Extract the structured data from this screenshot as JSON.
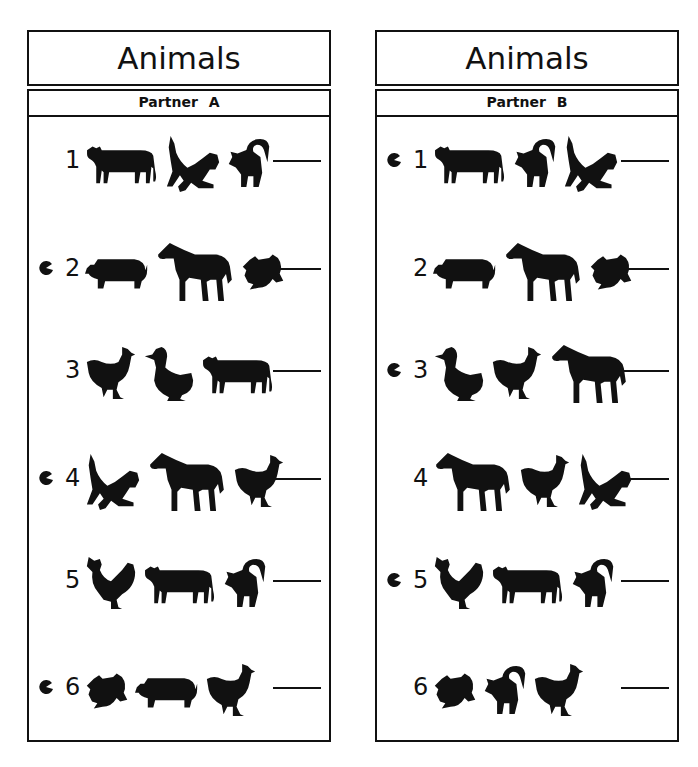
{
  "colors": {
    "ink": "#111111",
    "paper": "#ffffff"
  },
  "panels": [
    {
      "title": "Animals",
      "partner_label": "Partner A",
      "rows": [
        {
          "number": "1",
          "marked": false,
          "animals": [
            "cow",
            "cat-dog",
            "cat-arched"
          ]
        },
        {
          "number": "2",
          "marked": true,
          "animals": [
            "pig",
            "horse",
            "frog"
          ]
        },
        {
          "number": "3",
          "marked": false,
          "animals": [
            "hen",
            "duck",
            "cow"
          ]
        },
        {
          "number": "4",
          "marked": true,
          "animals": [
            "cat-dog",
            "horse",
            "hen"
          ]
        },
        {
          "number": "5",
          "marked": false,
          "animals": [
            "rooster",
            "cow",
            "cat-arched"
          ]
        },
        {
          "number": "6",
          "marked": true,
          "animals": [
            "frog",
            "pig",
            "hen"
          ]
        }
      ]
    },
    {
      "title": "Animals",
      "partner_label": "Partner B",
      "rows": [
        {
          "number": "1",
          "marked": true,
          "animals": [
            "cow",
            "cat-arched",
            "cat-dog"
          ]
        },
        {
          "number": "2",
          "marked": false,
          "animals": [
            "pig",
            "horse",
            "frog"
          ]
        },
        {
          "number": "3",
          "marked": true,
          "animals": [
            "duck",
            "hen",
            "horse"
          ]
        },
        {
          "number": "4",
          "marked": false,
          "animals": [
            "horse",
            "hen",
            "cat-dog"
          ]
        },
        {
          "number": "5",
          "marked": true,
          "animals": [
            "rooster",
            "cow",
            "cat-arched"
          ]
        },
        {
          "number": "6",
          "marked": false,
          "animals": [
            "frog",
            "cat-arched",
            "hen"
          ]
        }
      ]
    }
  ]
}
